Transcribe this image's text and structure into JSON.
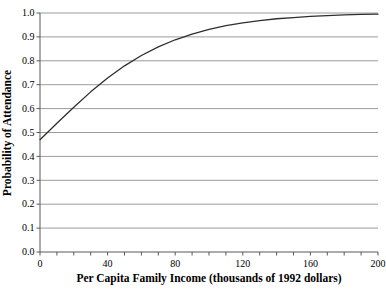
{
  "figure": {
    "background_color": "#ffffff",
    "axis_color": "#595959",
    "grid_color": "#9c9c9c",
    "curve_color": "#2e2e2e",
    "text_color": "#000000"
  },
  "chart_data": {
    "type": "line",
    "title": "",
    "xlabel": "Per Capita Family Income (thousands of 1992 dollars)",
    "ylabel": "Probability of Attendance",
    "xlim": [
      0,
      200
    ],
    "ylim": [
      0,
      1
    ],
    "x_major_ticks": [
      0,
      40,
      80,
      120,
      160,
      200
    ],
    "x_major_tick_labels": [
      "0",
      "40",
      "80",
      "120",
      "160",
      "200"
    ],
    "x_minor_tick_step": 10,
    "y_ticks": [
      0,
      0.1,
      0.2,
      0.3,
      0.4,
      0.5,
      0.6,
      0.7,
      0.8,
      0.9,
      1.0
    ],
    "y_tick_labels": [
      "0.0",
      "0.1",
      "0.2",
      "0.3",
      "0.4",
      "0.5",
      "0.6",
      "0.7",
      "0.8",
      "0.9",
      "1.0"
    ],
    "grid": "horizontal-only",
    "legend": "none",
    "series": [
      {
        "name": "Probability of Attendance",
        "x": [
          0,
          10,
          20,
          30,
          40,
          50,
          60,
          70,
          80,
          90,
          100,
          110,
          120,
          130,
          140,
          150,
          160,
          170,
          180,
          190,
          200
        ],
        "y": [
          0.47,
          0.539,
          0.606,
          0.67,
          0.728,
          0.779,
          0.822,
          0.858,
          0.888,
          0.912,
          0.931,
          0.947,
          0.959,
          0.968,
          0.976,
          0.981,
          0.986,
          0.989,
          0.992,
          0.994,
          0.995
        ]
      }
    ]
  }
}
